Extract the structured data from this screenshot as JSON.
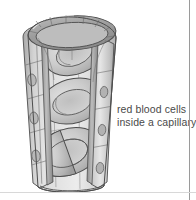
{
  "figure": {
    "title": "red blood cells inside a capillary",
    "caption_lines": [
      "red blood cells",
      "inside a capillary"
    ],
    "style": {
      "background": "#ffffff",
      "text_color": "#4a4a4a",
      "outline_color": "#4d4d4d",
      "wall_light": "#e2e2e2",
      "wall_mid": "#c9c9c9",
      "wall_dark": "#9f9f9f",
      "cell_light": "#d5d5d5",
      "cell_mid": "#bdbdbd",
      "cell_dark": "#a5a5a5",
      "frame_line": "#9a9a9a"
    },
    "elements": {
      "capillary_label": "capillary tube cutaway",
      "endothelial_wall_label": "endothelial cell wall",
      "nucleus_label": "endothelial nucleus",
      "red_blood_cell_label": "red blood cell",
      "rbc_count": 3,
      "nucleus_count": 6,
      "lumen_label": "capillary lumen"
    }
  }
}
